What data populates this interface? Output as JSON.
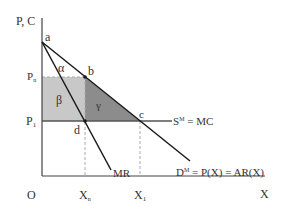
{
  "axes": {
    "y_label": "P, C",
    "x_label": "X",
    "origin_label": "O"
  },
  "points": {
    "a": "a",
    "b": "b",
    "c": "c",
    "d": "d"
  },
  "price_labels": {
    "pn": "P",
    "pn_sub": "n",
    "p1": "P",
    "p1_sub": "1"
  },
  "quantity_labels": {
    "xn": "X",
    "xn_sub": "n",
    "x1": "X",
    "x1_sub": "1"
  },
  "areas": {
    "alpha": "α",
    "beta": "β",
    "gamma": "γ"
  },
  "curves": {
    "mr": "MR",
    "supply": "S",
    "supply_sup": "M",
    "supply_rest": " = MC",
    "demand": "D",
    "demand_sup": "M",
    "demand_rest": " = P(X) = AR(X)"
  },
  "colors": {
    "beta_fill": "#c8c8c8",
    "gamma_fill": "#8c8c8c",
    "line": "#1a1a1a",
    "axis": "#444444",
    "dashed": "#999999"
  }
}
